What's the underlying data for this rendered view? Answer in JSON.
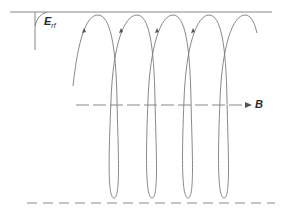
{
  "diagram": {
    "type": "helical trajectory in magnetic field",
    "labels": {
      "field_main": "E",
      "field_sub": "rf",
      "axis": "B"
    },
    "colors": {
      "line": "#7a7a7a",
      "label": "#2a2a2a",
      "background": "#ffffff"
    },
    "helix": {
      "crests_x": [
        98,
        137,
        173,
        209,
        245
      ],
      "troughs_x": [
        116,
        155,
        191,
        227
      ],
      "top_y": 15,
      "bottom_y": 198,
      "loops": 4
    },
    "axis_line_y": 105,
    "top_boundary_y": 12,
    "bottom_dashed_y": 203
  }
}
